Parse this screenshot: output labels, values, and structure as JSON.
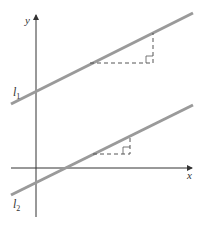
{
  "diagram": {
    "title": "",
    "axes": {
      "x_label": "x",
      "y_label": "y"
    },
    "lines": [
      {
        "name": "l",
        "subscript": "1",
        "color": "#9a9a9a"
      },
      {
        "name": "l",
        "subscript": "2",
        "color": "#9a9a9a"
      }
    ],
    "colors": {
      "axis": "#333333",
      "line": "#9a9a9a",
      "dashed": "#555555"
    }
  }
}
